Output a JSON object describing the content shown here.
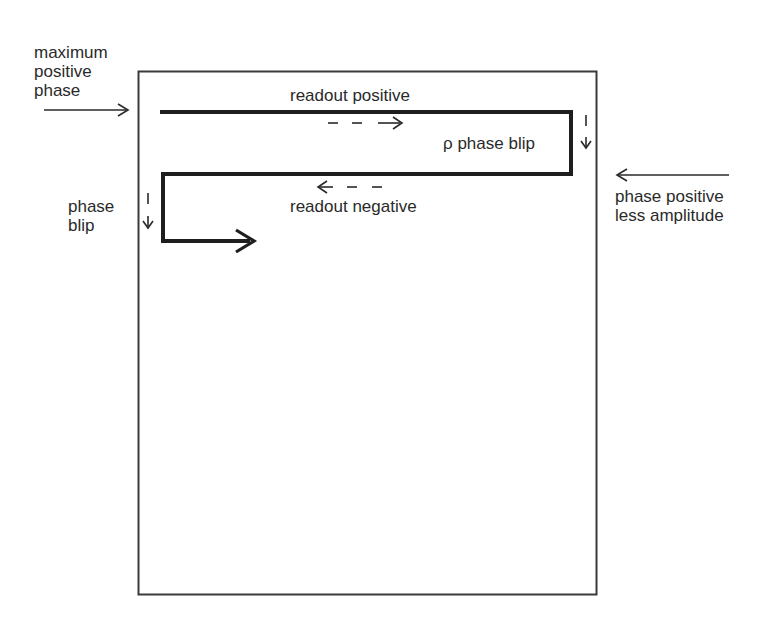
{
  "diagram": {
    "labels": {
      "max_positive_phase": "maximum\npositive\nphase",
      "readout_positive": "readout positive",
      "pi_phase_blip": "ρ phase blip",
      "phase_positive_less_amplitude": "phase positive\nless amplitude",
      "readout_negative": "readout negative",
      "phase_blip": "phase\nblip"
    },
    "colors": {
      "stroke": "#2a2a2a",
      "frame": "#3a3a3a",
      "background": "#ffffff"
    }
  }
}
